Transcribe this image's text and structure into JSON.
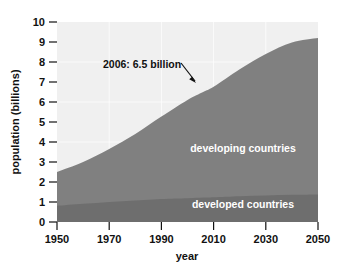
{
  "chart_data": {
    "type": "area",
    "title": "",
    "subtitle": "",
    "xlabel": "year",
    "ylabel": "population (billions)",
    "xlim": [
      1950,
      2050
    ],
    "ylim": [
      0,
      10
    ],
    "xticks": [
      1950,
      1970,
      1990,
      2010,
      2030,
      2050
    ],
    "xticklabels": [
      "1950",
      "1970",
      "1990",
      "2010",
      "2030",
      "2050"
    ],
    "yticks": [
      0,
      1,
      2,
      3,
      4,
      5,
      6,
      7,
      8,
      9,
      10
    ],
    "yticklabels": [
      "0",
      "1",
      "2",
      "3",
      "4",
      "5",
      "6",
      "7",
      "8",
      "9",
      "10"
    ],
    "grid": true,
    "stacked": true,
    "legend_position": "inside-plot-labels",
    "x": [
      1950,
      1960,
      1970,
      1980,
      1990,
      2000,
      2006,
      2010,
      2020,
      2030,
      2040,
      2050
    ],
    "series": [
      {
        "name": "developed countries",
        "color": "#6e6e6e",
        "values": [
          0.81,
          0.91,
          1.0,
          1.08,
          1.15,
          1.19,
          1.22,
          1.24,
          1.29,
          1.33,
          1.36,
          1.38
        ]
      },
      {
        "name": "developing countries",
        "color": "#808080",
        "values": [
          1.69,
          2.09,
          2.65,
          3.32,
          4.12,
          4.91,
          5.28,
          5.52,
          6.35,
          7.07,
          7.62,
          7.82
        ]
      }
    ],
    "totals": [
      2.5,
      3.0,
      3.65,
      4.4,
      5.27,
      6.1,
      6.5,
      6.76,
      7.64,
      8.4,
      8.98,
      9.2
    ],
    "annotations": [
      {
        "text": "2006: 6.5 billion",
        "x": 2006,
        "y": 6.5,
        "arrow": true
      }
    ],
    "plot_background": "#f0f0f0",
    "axis_color": "#111111"
  },
  "axes": {
    "y_title": "population (billions)",
    "x_title": "year"
  },
  "labels": {
    "developing": "developing countries",
    "developed": "developed countries",
    "annotation": "2006: 6.5 billion"
  }
}
